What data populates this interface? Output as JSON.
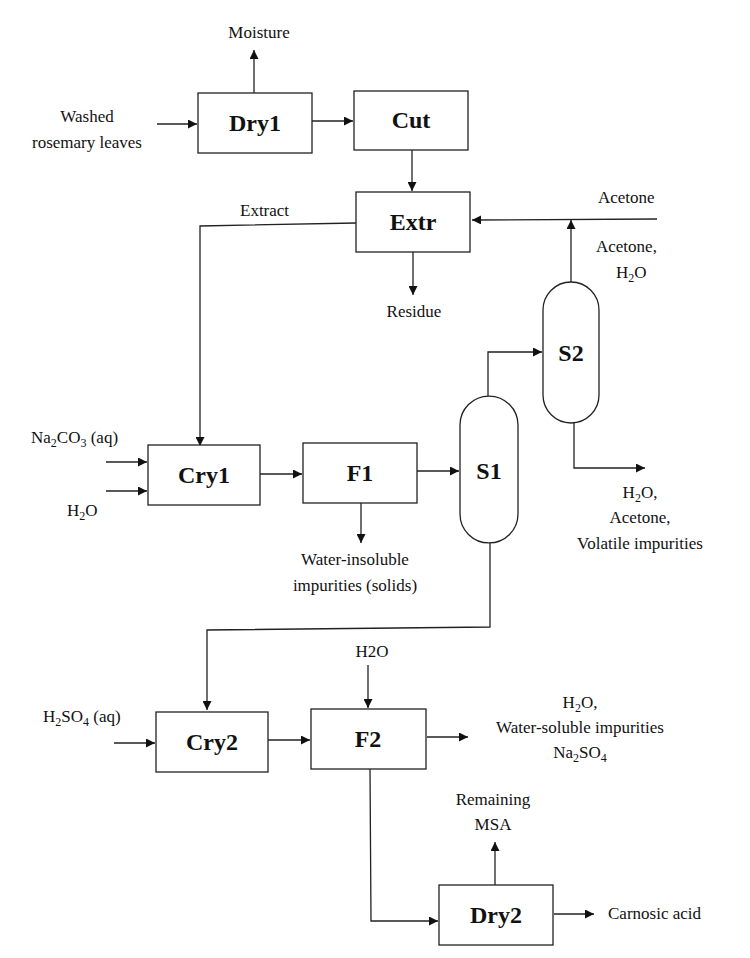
{
  "diagram": {
    "units": {
      "dry1": "Dry1",
      "cut": "Cut",
      "extr": "Extr",
      "cry1": "Cry1",
      "f1": "F1",
      "s1": "S1",
      "s2": "S2",
      "cry2": "Cry2",
      "f2": "F2",
      "dry2": "Dry2"
    },
    "streams": {
      "moisture": "Moisture",
      "washed_line1": "Washed",
      "washed_line2": "rosemary leaves",
      "extract": "Extract",
      "acetone_feed": "Acetone",
      "acetone_h2o_line1": "Acetone,",
      "acetone_h2o_line2_main": "H",
      "acetone_h2o_line2_sub": "2",
      "acetone_h2o_line2_tail": "O",
      "residue": "Residue",
      "na2co3_a": "Na",
      "na2co3_sub1": "2",
      "na2co3_b": "CO",
      "na2co3_sub2": "3",
      "na2co3_c": " (aq)",
      "h2o_cry1_a": "H",
      "h2o_cry1_sub": "2",
      "h2o_cry1_b": "O",
      "insoluble_line1": "Water-insoluble",
      "insoluble_line2": "impurities (solids)",
      "s2_bottom_line1_a": "H",
      "s2_bottom_line1_sub": "2",
      "s2_bottom_line1_b": "O,",
      "s2_bottom_line2": "Acetone,",
      "s2_bottom_line3": "Volatile impurities",
      "h2o_f2": "H2O",
      "h2so4_a": "H",
      "h2so4_sub1": "2",
      "h2so4_b": "SO",
      "h2so4_sub2": "4",
      "h2so4_c": " (aq)",
      "f2_out_line1_a": "H",
      "f2_out_line1_sub": "2",
      "f2_out_line1_b": "O,",
      "f2_out_line2": "Water-soluble impurities",
      "f2_out_line3_a": "Na",
      "f2_out_line3_sub1": "2",
      "f2_out_line3_b": "SO",
      "f2_out_line3_sub2": "4",
      "remaining_line1": "Remaining",
      "remaining_line2": "MSA",
      "carnosic": "Carnosic acid"
    },
    "colors": {
      "stroke": "#222222",
      "text": "#111111",
      "background": "#ffffff"
    }
  }
}
